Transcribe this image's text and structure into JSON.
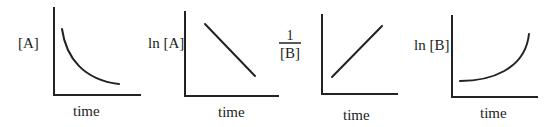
{
  "diagram": {
    "panels": [
      {
        "id": "p1",
        "ylabel": "[A]",
        "xlabel": "time",
        "shape": "decaying curve (concave up, decreasing)"
      },
      {
        "id": "p2",
        "ylabel": "ln [A]",
        "xlabel": "time",
        "shape": "straight line, negative slope"
      },
      {
        "id": "p3",
        "ylabel_numerator": "1",
        "ylabel_denominator": "[B]",
        "xlabel": "time",
        "shape": "straight line, positive slope"
      },
      {
        "id": "p4",
        "ylabel": "ln [B]",
        "xlabel": "time",
        "shape": "increasing curve (concave up, rising)"
      }
    ]
  },
  "colors": {
    "ink": "#222222",
    "background": "#ffffff"
  }
}
